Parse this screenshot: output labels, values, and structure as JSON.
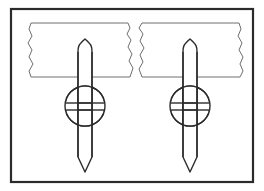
{
  "figure": {
    "canvas": {
      "width": 264,
      "height": 191,
      "background": "#ffffff"
    },
    "colors": {
      "outer_frame_stroke": "#2b2b2b",
      "paper_strip_stroke": "#6e6e6e",
      "spike_stroke": "#2b2b2b",
      "hub_stroke": "#2b2b2b",
      "fill": "#ffffff"
    },
    "stroke_widths": {
      "outer_frame": 2.2,
      "paper_strip": 1.0,
      "spike": 1.4,
      "hub": 1.4
    }
  },
  "outer_frame": {
    "label": "figure-border",
    "x": 11,
    "y": 9,
    "width": 242,
    "height": 173
  },
  "paper_strips": [
    {
      "id": "left-torn-strip",
      "label": "Left torn paper strip",
      "top": 23,
      "bottom": 77,
      "left": 28,
      "right": 133,
      "left_edge": "ragged",
      "right_edge": "ragged",
      "path": "M 31 23 L 128 23 L 130 28 L 127 34 L 131 40 L 128 47 L 132 54 L 129 61 L 133 68 L 130 77 L 31 77 L 29 71 L 33 64 L 29 57 L 32 50 L 28 43 L 32 36 L 29 29 Z"
    },
    {
      "id": "right-torn-strip",
      "label": "Right torn paper strip",
      "top": 23,
      "bottom": 77,
      "left": 139,
      "right": 243,
      "left_edge": "ragged",
      "right_edge": "ragged",
      "path": "M 142 23 L 239 23 L 241 29 L 238 36 L 242 43 L 239 50 L 243 57 L 240 64 L 243 71 L 240 77 L 142 77 L 139 69 L 143 62 L 140 55 L 144 48 L 140 41 L 143 34 L 139 28 Z"
    }
  ],
  "assemblies": [
    {
      "id": "left-bolt-assembly",
      "label": "Left spike and hub assembly",
      "center_x": 85,
      "spike": {
        "label": "Pointed vertical spike",
        "top_y": 39,
        "bottom_y": 172,
        "half_width": 7,
        "tip_top_y": 39,
        "shoulder_y": 52,
        "tip_bottom_y": 172,
        "heel_y": 157
      },
      "hub": {
        "label": "Circular hub with H glyph",
        "center_y": 106,
        "radius": 20,
        "band_half_width": 7,
        "crossbar_top_y": 103,
        "crossbar_bottom_y": 110,
        "glyph": "H"
      }
    },
    {
      "id": "right-bolt-assembly",
      "label": "Right spike and hub assembly",
      "center_x": 190,
      "spike": {
        "label": "Pointed vertical spike",
        "top_y": 39,
        "bottom_y": 172,
        "half_width": 7,
        "tip_top_y": 39,
        "shoulder_y": 52,
        "tip_bottom_y": 172,
        "heel_y": 157
      },
      "hub": {
        "label": "Circular hub with H glyph",
        "center_y": 106,
        "radius": 20,
        "band_half_width": 7,
        "crossbar_top_y": 103,
        "crossbar_bottom_y": 110,
        "glyph": "H"
      }
    }
  ]
}
